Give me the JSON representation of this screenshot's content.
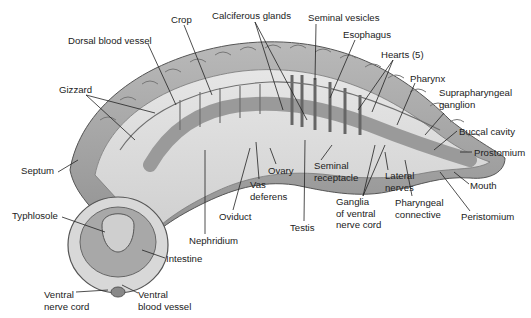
{
  "diagram": {
    "labels": [
      {
        "id": "crop",
        "text": "Crop",
        "x": 171,
        "y": 14
      },
      {
        "id": "calciferous",
        "text": "Calciferous glands",
        "x": 212,
        "y": 10
      },
      {
        "id": "seminal-vesicles",
        "text": "Seminal vesicles",
        "x": 308,
        "y": 12
      },
      {
        "id": "esophagus",
        "text": "Esophagus",
        "x": 343,
        "y": 29
      },
      {
        "id": "dorsal-vessel",
        "text": "Dorsal blood vessel",
        "x": 68,
        "y": 35
      },
      {
        "id": "hearts",
        "text": "Hearts (5)",
        "x": 381,
        "y": 49
      },
      {
        "id": "pharynx",
        "text": "Pharynx",
        "x": 410,
        "y": 73
      },
      {
        "id": "gizzard",
        "text": "Gizzard",
        "x": 59,
        "y": 84
      },
      {
        "id": "supra",
        "text": "Suprapharyngeal\nganglion",
        "x": 439,
        "y": 87
      },
      {
        "id": "buccal",
        "text": "Buccal cavity",
        "x": 459,
        "y": 126
      },
      {
        "id": "prostomium",
        "text": "Prostomium",
        "x": 474,
        "y": 147
      },
      {
        "id": "septum",
        "text": "Septum",
        "x": 21,
        "y": 165
      },
      {
        "id": "ovary",
        "text": "Ovary",
        "x": 268,
        "y": 165
      },
      {
        "id": "seminal-receptacle",
        "text": "Seminal\nreceptacle",
        "x": 314,
        "y": 160
      },
      {
        "id": "lateral-nerves",
        "text": "Lateral\nnerves",
        "x": 385,
        "y": 170
      },
      {
        "id": "mouth",
        "text": "Mouth",
        "x": 470,
        "y": 180
      },
      {
        "id": "vas-deferens",
        "text": "Vas\ndeferens",
        "x": 250,
        "y": 179
      },
      {
        "id": "ganglia",
        "text": "Ganglia\nof ventral\nnerve cord",
        "x": 336,
        "y": 196
      },
      {
        "id": "pharyngeal-connective",
        "text": "Pharyngeal\nconnective",
        "x": 395,
        "y": 197
      },
      {
        "id": "peristomium",
        "text": "Peristomium",
        "x": 461,
        "y": 211
      },
      {
        "id": "oviduct",
        "text": "Oviduct",
        "x": 219,
        "y": 211
      },
      {
        "id": "typhlosole",
        "text": "Typhlosole",
        "x": 12,
        "y": 210
      },
      {
        "id": "testis",
        "text": "Testis",
        "x": 290,
        "y": 222
      },
      {
        "id": "nephridium",
        "text": "Nephridium",
        "x": 189,
        "y": 235
      },
      {
        "id": "intestine",
        "text": "Intestine",
        "x": 166,
        "y": 253
      },
      {
        "id": "ventral-nerve-cord",
        "text": "Ventral\nnerve cord",
        "x": 44,
        "y": 289
      },
      {
        "id": "ventral-blood-vessel",
        "text": "Ventral\nblood vessel",
        "x": 138,
        "y": 289
      }
    ]
  }
}
